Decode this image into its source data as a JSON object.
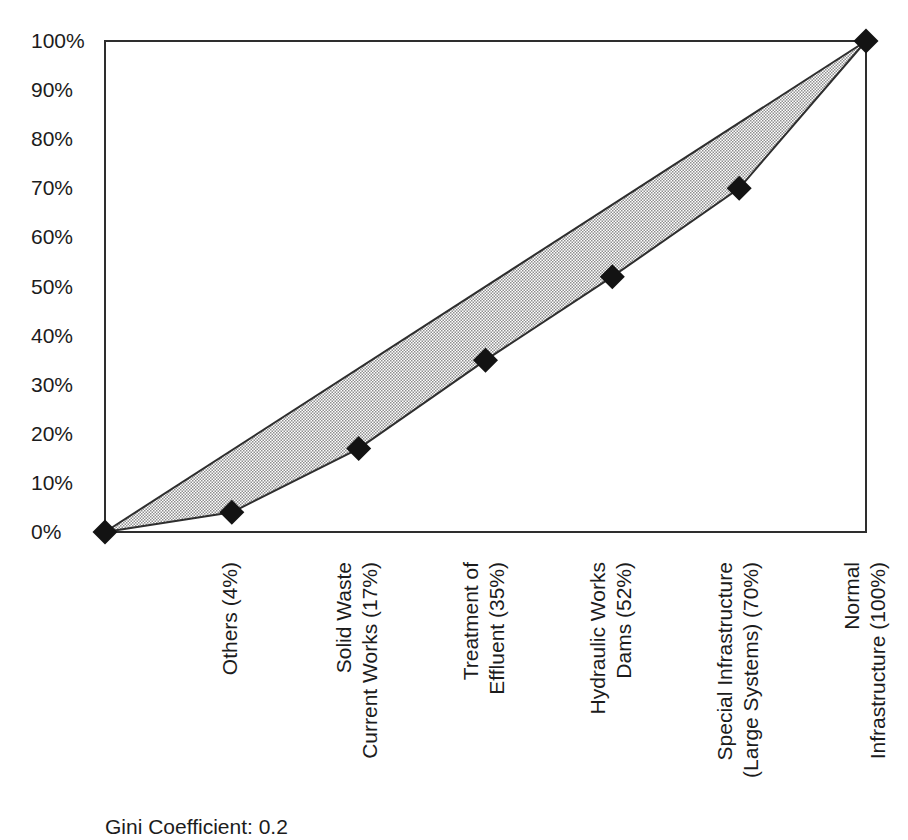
{
  "chart_data": {
    "type": "area",
    "subtype": "lorenz_curve",
    "title": "",
    "annotation": "Gini Coefficient: 0.2",
    "y_axis": {
      "min": 0,
      "max": 100,
      "tick_step": 10,
      "tick_labels": [
        "0%",
        "10%",
        "20%",
        "30%",
        "40%",
        "50%",
        "60%",
        "70%",
        "80%",
        "90%",
        "100%"
      ]
    },
    "x_axis": {
      "num_positions": 7,
      "rotation_deg": -90,
      "category_labels": [
        {
          "position": 1,
          "lines": [
            "Others (4%)"
          ]
        },
        {
          "position": 2,
          "lines": [
            "Solid Waste",
            "Current Works (17%)"
          ]
        },
        {
          "position": 3,
          "lines": [
            "Treatment of",
            "Effluent (35%)"
          ]
        },
        {
          "position": 4,
          "lines": [
            "Hydraulic Works",
            "Dams (52%)"
          ]
        },
        {
          "position": 5,
          "lines": [
            "Special Infrastructure",
            "(Large Systems) (70%)"
          ]
        },
        {
          "position": 6,
          "lines": [
            "Normal",
            "Infrastructure (100%)"
          ]
        }
      ]
    },
    "series": [
      {
        "name": "cumulative share curve",
        "marker": "diamond",
        "values": [
          0,
          4,
          17,
          35,
          52,
          70,
          100
        ]
      },
      {
        "name": "line of equality",
        "marker": "none",
        "points": [
          {
            "position": 0,
            "value": 0
          },
          {
            "position": 6,
            "value": 100
          }
        ]
      }
    ],
    "fill_between": {
      "style": "halftone",
      "between": [
        "line of equality",
        "cumulative share curve"
      ]
    },
    "gridlines": "none",
    "legend": "none",
    "colors": {
      "line": "#2e2e2e",
      "marker": "#131313",
      "text": "#1c1c1c",
      "halftone_dot": "#8f8f8f",
      "background": "#ffffff"
    }
  }
}
